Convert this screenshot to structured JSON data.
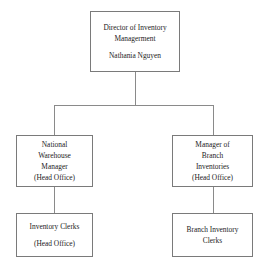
{
  "chart": {
    "type": "org-chart",
    "background_color": "#ffffff",
    "box_border_color": "#7a7a7a",
    "connector_color": "#8a8a8a",
    "text_color": "#1c1c1c"
  },
  "nodes": {
    "director": {
      "id": "director",
      "level": 1,
      "lines": [
        "Director of Inventory",
        "Managerment"
      ],
      "person": "Nathania Nguyen"
    },
    "national_warehouse_manager": {
      "id": "national-warehouse-manager",
      "level": 2,
      "lines": [
        "National",
        "Warehouse",
        "Manager",
        "(Head Office)"
      ]
    },
    "branch_inventories_manager": {
      "id": "branch-inventories-manager",
      "level": 2,
      "lines": [
        "Manager of",
        "Branch",
        "Inventories",
        "(Head Office)"
      ]
    },
    "inventory_clerks": {
      "id": "inventory-clerks",
      "level": 3,
      "lines": [
        "Inventory Clerks"
      ],
      "location": "(Head Office)"
    },
    "branch_inventory_clerks": {
      "id": "branch-inventory-clerks",
      "level": 3,
      "lines": [
        "Branch Inventory",
        "Clerks"
      ]
    }
  }
}
